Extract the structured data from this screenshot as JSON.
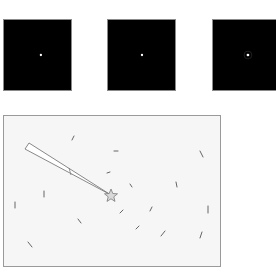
{
  "thumbnails": [
    {
      "id": "thumb-1",
      "background": "#000000",
      "dot_color": "#ffffff",
      "dot": {
        "x": 38,
        "y": 36
      },
      "halo": false
    },
    {
      "id": "thumb-2",
      "background": "#000000",
      "dot_color": "#ffffff",
      "dot": {
        "x": 35,
        "y": 36
      },
      "halo": false
    },
    {
      "id": "thumb-3",
      "background": "#000000",
      "dot_color": "#ffffff",
      "dot": {
        "x": 36,
        "y": 36
      },
      "halo": true
    }
  ],
  "scene": {
    "background": "#f6f6f6",
    "border": "#9a9a9a",
    "star": {
      "x": 107,
      "y": 79,
      "color": "#8a8a8a"
    },
    "wedge": {
      "tip": {
        "x": 107,
        "y": 79
      },
      "corner_a": {
        "x": 25,
        "y": 27
      },
      "corner_b": {
        "x": 21,
        "y": 33
      },
      "divider": {
        "x1": 65,
        "y1": 52,
        "x2": 67,
        "y2": 59
      },
      "stroke": "#7a7a7a"
    },
    "marks": [
      {
        "x1": 70,
        "y1": 20,
        "x2": 68,
        "y2": 24
      },
      {
        "x1": 110,
        "y1": 35,
        "x2": 114,
        "y2": 35
      },
      {
        "x1": 196,
        "y1": 35,
        "x2": 199,
        "y2": 41
      },
      {
        "x1": 103,
        "y1": 57,
        "x2": 106,
        "y2": 56
      },
      {
        "x1": 172,
        "y1": 66,
        "x2": 173,
        "y2": 71
      },
      {
        "x1": 126,
        "y1": 68,
        "x2": 128,
        "y2": 71
      },
      {
        "x1": 40,
        "y1": 75,
        "x2": 40,
        "y2": 81
      },
      {
        "x1": 11,
        "y1": 86,
        "x2": 11,
        "y2": 92
      },
      {
        "x1": 148,
        "y1": 91,
        "x2": 146,
        "y2": 95
      },
      {
        "x1": 204,
        "y1": 90,
        "x2": 204,
        "y2": 97
      },
      {
        "x1": 119,
        "y1": 94,
        "x2": 116,
        "y2": 97
      },
      {
        "x1": 74,
        "y1": 103,
        "x2": 77,
        "y2": 107
      },
      {
        "x1": 135,
        "y1": 110,
        "x2": 132,
        "y2": 113
      },
      {
        "x1": 161,
        "y1": 115,
        "x2": 157,
        "y2": 120
      },
      {
        "x1": 198,
        "y1": 116,
        "x2": 196,
        "y2": 122
      },
      {
        "x1": 24,
        "y1": 126,
        "x2": 28,
        "y2": 131
      }
    ],
    "mark_color": "#555555"
  }
}
